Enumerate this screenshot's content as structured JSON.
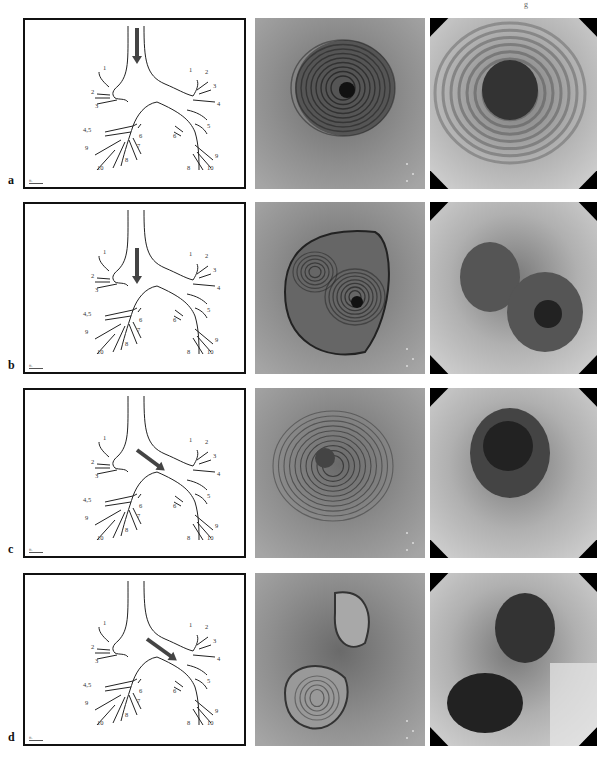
{
  "page": {
    "corner_mark": "g"
  },
  "figure": {
    "rows": [
      {
        "label": "a",
        "arrow_position": "trachea",
        "top": 18,
        "height": 171
      },
      {
        "label": "b",
        "arrow_position": "lower-trachea",
        "top": 202,
        "height": 172
      },
      {
        "label": "c",
        "arrow_position": "left-main-bronchus",
        "top": 388,
        "height": 170
      },
      {
        "label": "d",
        "arrow_position": "left-upper-lobe-orifice",
        "top": 573,
        "height": 173
      }
    ],
    "diagram_labels": {
      "right": [
        "1",
        "2",
        "3",
        "4,5",
        "6",
        "7",
        "8",
        "9",
        "10"
      ],
      "left": [
        "1",
        "2",
        "3",
        "4",
        "5",
        "6",
        "8",
        "9",
        "10"
      ]
    },
    "scalebar_text": "ft.",
    "colors": {
      "arrow": "#444444",
      "line": "#222222",
      "frame": "#111111",
      "vb_tone": "#8a8a8a",
      "endo_tone": "#b5b5b5"
    }
  }
}
